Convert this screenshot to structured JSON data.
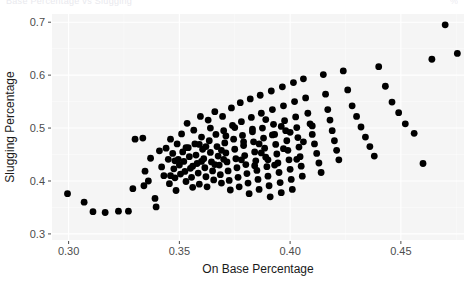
{
  "header": {
    "clipped_title": "Base Percentage vs Slugging",
    "clipped_corner": "%"
  },
  "chart_data": {
    "type": "scatter",
    "title": "",
    "xlabel": "On Base Percentage",
    "ylabel": "Slugging Percentage",
    "xlim": [
      0.2925,
      0.4785
    ],
    "ylim": [
      0.2885,
      0.7155
    ],
    "xticks": [
      0.3,
      0.35,
      0.4,
      0.45
    ],
    "xticklabels": [
      "0.30",
      "0.35",
      "0.40",
      "0.45"
    ],
    "yticks": [
      0.3,
      0.4,
      0.5,
      0.6,
      0.7
    ],
    "yticklabels": [
      "0.3",
      "0.4",
      "0.5",
      "0.6",
      "0.7"
    ],
    "grid": true,
    "grid_color": "#ffffff",
    "panel_background": "#f5f5f5",
    "point_color": "#000000",
    "point_size": 3.4,
    "legend": null,
    "points": [
      [
        0.2995,
        0.376
      ],
      [
        0.307,
        0.36
      ],
      [
        0.311,
        0.342
      ],
      [
        0.3165,
        0.3405
      ],
      [
        0.3225,
        0.343
      ],
      [
        0.327,
        0.343
      ],
      [
        0.329,
        0.3855
      ],
      [
        0.33,
        0.479
      ],
      [
        0.3335,
        0.481
      ],
      [
        0.3345,
        0.4185
      ],
      [
        0.336,
        0.4
      ],
      [
        0.337,
        0.443
      ],
      [
        0.339,
        0.367
      ],
      [
        0.3395,
        0.351
      ],
      [
        0.341,
        0.457
      ],
      [
        0.342,
        0.4265
      ],
      [
        0.343,
        0.41
      ],
      [
        0.344,
        0.462
      ],
      [
        0.345,
        0.441
      ],
      [
        0.3455,
        0.395
      ],
      [
        0.346,
        0.479
      ],
      [
        0.347,
        0.452
      ],
      [
        0.3475,
        0.423
      ],
      [
        0.348,
        0.406
      ],
      [
        0.3485,
        0.382
      ],
      [
        0.349,
        0.47
      ],
      [
        0.3495,
        0.441
      ],
      [
        0.35,
        0.43
      ],
      [
        0.3505,
        0.413
      ],
      [
        0.351,
        0.489
      ],
      [
        0.3515,
        0.455
      ],
      [
        0.352,
        0.437
      ],
      [
        0.3525,
        0.418
      ],
      [
        0.353,
        0.399
      ],
      [
        0.3535,
        0.509
      ],
      [
        0.354,
        0.463
      ],
      [
        0.3545,
        0.446
      ],
      [
        0.355,
        0.424
      ],
      [
        0.3555,
        0.407
      ],
      [
        0.356,
        0.388
      ],
      [
        0.3565,
        0.496
      ],
      [
        0.357,
        0.47
      ],
      [
        0.3575,
        0.449
      ],
      [
        0.358,
        0.433
      ],
      [
        0.3585,
        0.415
      ],
      [
        0.359,
        0.394
      ],
      [
        0.3595,
        0.522
      ],
      [
        0.36,
        0.483
      ],
      [
        0.3605,
        0.46
      ],
      [
        0.361,
        0.442
      ],
      [
        0.3615,
        0.425
      ],
      [
        0.362,
        0.408
      ],
      [
        0.3625,
        0.389
      ],
      [
        0.363,
        0.515
      ],
      [
        0.3635,
        0.476
      ],
      [
        0.364,
        0.454
      ],
      [
        0.3645,
        0.436
      ],
      [
        0.365,
        0.419
      ],
      [
        0.3655,
        0.402
      ],
      [
        0.366,
        0.531
      ],
      [
        0.3665,
        0.488
      ],
      [
        0.367,
        0.465
      ],
      [
        0.3675,
        0.447
      ],
      [
        0.368,
        0.43
      ],
      [
        0.3685,
        0.412
      ],
      [
        0.369,
        0.396
      ],
      [
        0.3695,
        0.522
      ],
      [
        0.37,
        0.495
      ],
      [
        0.3705,
        0.472
      ],
      [
        0.371,
        0.453
      ],
      [
        0.3715,
        0.436
      ],
      [
        0.372,
        0.419
      ],
      [
        0.3725,
        0.401
      ],
      [
        0.373,
        0.383
      ],
      [
        0.3735,
        0.538
      ],
      [
        0.374,
        0.505
      ],
      [
        0.3745,
        0.479
      ],
      [
        0.375,
        0.46
      ],
      [
        0.3755,
        0.442
      ],
      [
        0.376,
        0.425
      ],
      [
        0.3765,
        0.407
      ],
      [
        0.377,
        0.389
      ],
      [
        0.3775,
        0.548
      ],
      [
        0.378,
        0.512
      ],
      [
        0.3785,
        0.486
      ],
      [
        0.379,
        0.467
      ],
      [
        0.3795,
        0.448
      ],
      [
        0.38,
        0.431
      ],
      [
        0.3805,
        0.414
      ],
      [
        0.381,
        0.396
      ],
      [
        0.3815,
        0.376
      ],
      [
        0.382,
        0.555
      ],
      [
        0.3825,
        0.52
      ],
      [
        0.383,
        0.493
      ],
      [
        0.3835,
        0.474
      ],
      [
        0.384,
        0.455
      ],
      [
        0.3845,
        0.438
      ],
      [
        0.385,
        0.42
      ],
      [
        0.3855,
        0.403
      ],
      [
        0.386,
        0.384
      ],
      [
        0.3865,
        0.562
      ],
      [
        0.387,
        0.528
      ],
      [
        0.3875,
        0.5
      ],
      [
        0.388,
        0.481
      ],
      [
        0.3885,
        0.462
      ],
      [
        0.389,
        0.445
      ],
      [
        0.3895,
        0.427
      ],
      [
        0.39,
        0.409
      ],
      [
        0.3905,
        0.391
      ],
      [
        0.391,
        0.37
      ],
      [
        0.3915,
        0.57
      ],
      [
        0.392,
        0.535
      ],
      [
        0.3925,
        0.507
      ],
      [
        0.393,
        0.488
      ],
      [
        0.3935,
        0.469
      ],
      [
        0.394,
        0.451
      ],
      [
        0.3945,
        0.434
      ],
      [
        0.395,
        0.416
      ],
      [
        0.3955,
        0.397
      ],
      [
        0.396,
        0.378
      ],
      [
        0.3965,
        0.578
      ],
      [
        0.397,
        0.542
      ],
      [
        0.3975,
        0.514
      ],
      [
        0.398,
        0.495
      ],
      [
        0.3985,
        0.476
      ],
      [
        0.399,
        0.458
      ],
      [
        0.3995,
        0.44
      ],
      [
        0.4,
        0.422
      ],
      [
        0.4005,
        0.403
      ],
      [
        0.401,
        0.384
      ],
      [
        0.4015,
        0.586
      ],
      [
        0.402,
        0.55
      ],
      [
        0.4025,
        0.521
      ],
      [
        0.403,
        0.501
      ],
      [
        0.4035,
        0.482
      ],
      [
        0.404,
        0.464
      ],
      [
        0.4045,
        0.446
      ],
      [
        0.405,
        0.428
      ],
      [
        0.4055,
        0.409
      ],
      [
        0.406,
        0.593
      ],
      [
        0.407,
        0.557
      ],
      [
        0.408,
        0.528
      ],
      [
        0.409,
        0.508
      ],
      [
        0.41,
        0.488
      ],
      [
        0.411,
        0.47
      ],
      [
        0.412,
        0.452
      ],
      [
        0.413,
        0.434
      ],
      [
        0.414,
        0.416
      ],
      [
        0.415,
        0.601
      ],
      [
        0.416,
        0.564
      ],
      [
        0.417,
        0.535
      ],
      [
        0.418,
        0.515
      ],
      [
        0.419,
        0.495
      ],
      [
        0.42,
        0.476
      ],
      [
        0.421,
        0.458
      ],
      [
        0.422,
        0.44
      ],
      [
        0.424,
        0.608
      ],
      [
        0.426,
        0.572
      ],
      [
        0.428,
        0.542
      ],
      [
        0.43,
        0.522
      ],
      [
        0.432,
        0.502
      ],
      [
        0.434,
        0.483
      ],
      [
        0.436,
        0.465
      ],
      [
        0.438,
        0.447
      ],
      [
        0.44,
        0.616
      ],
      [
        0.443,
        0.579
      ],
      [
        0.446,
        0.549
      ],
      [
        0.449,
        0.529
      ],
      [
        0.452,
        0.508
      ],
      [
        0.456,
        0.49
      ],
      [
        0.46,
        0.433
      ],
      [
        0.464,
        0.63
      ],
      [
        0.47,
        0.695
      ],
      [
        0.4755,
        0.641
      ],
      [
        0.334,
        0.391
      ],
      [
        0.362,
        0.465
      ],
      [
        0.378,
        0.44
      ],
      [
        0.386,
        0.47
      ],
      [
        0.393,
        0.43
      ],
      [
        0.37,
        0.441
      ],
      [
        0.356,
        0.428
      ],
      [
        0.383,
        0.498
      ],
      [
        0.396,
        0.503
      ],
      [
        0.359,
        0.469
      ],
      [
        0.375,
        0.501
      ],
      [
        0.403,
        0.441
      ],
      [
        0.389,
        0.516
      ],
      [
        0.366,
        0.431
      ],
      [
        0.348,
        0.438
      ],
      [
        0.392,
        0.487
      ],
      [
        0.406,
        0.474
      ],
      [
        0.371,
        0.485
      ],
      [
        0.353,
        0.463
      ],
      [
        0.384,
        0.429
      ],
      [
        0.397,
        0.461
      ],
      [
        0.364,
        0.5
      ],
      [
        0.346,
        0.41
      ],
      [
        0.39,
        0.44
      ],
      [
        0.41,
        0.504
      ],
      [
        0.379,
        0.474
      ],
      [
        0.36,
        0.437
      ],
      [
        0.387,
        0.453
      ],
      [
        0.4,
        0.492
      ],
      [
        0.369,
        0.458
      ]
    ]
  }
}
